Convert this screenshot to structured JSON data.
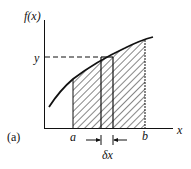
{
  "figure": {
    "panel_label": "(a)",
    "y_axis_label": "f(x)",
    "x_axis_label": "x",
    "y_value_label": "y",
    "lower_bound_label": "a",
    "upper_bound_label": "b",
    "strip_width_label": "δx",
    "colors": {
      "ink": "#111111",
      "background": "#ffffff"
    }
  }
}
